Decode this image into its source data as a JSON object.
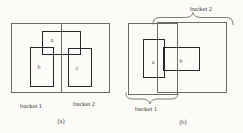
{
  "colors": {
    "background": "#fcfbf8",
    "thin_line": "#6b6b66",
    "thick_line": "#26262a",
    "text": "#3c3c38"
  },
  "figure_a": {
    "caption": "(a)",
    "bucket1_label": "bucket 1",
    "bucket2_label": "bucket 2",
    "rects": {
      "a": "a",
      "b": "b",
      "c": "c"
    }
  },
  "figure_b": {
    "caption": "(b)",
    "bucket1_label": "bucket 1",
    "bucket2_label": "bucket 2",
    "rects": {
      "a": "a",
      "b": "b"
    }
  }
}
